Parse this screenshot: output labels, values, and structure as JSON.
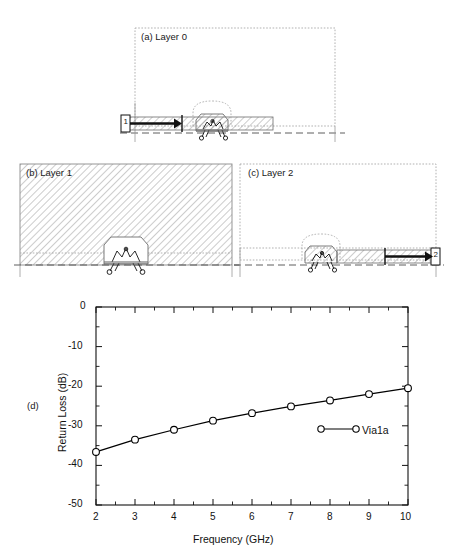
{
  "figure": {
    "panels": [
      {
        "id": "a",
        "label": "(a) Layer 0",
        "port_marker": "1"
      },
      {
        "id": "b",
        "label": "(b) Layer 1",
        "port_marker": ""
      },
      {
        "id": "c",
        "label": "(c) Layer 2",
        "port_marker": "2"
      },
      {
        "id": "d",
        "label": "(d)",
        "port_marker": ""
      }
    ]
  },
  "chart_data": {
    "type": "line",
    "title": "",
    "xlabel": "Frequency  (GHz)",
    "ylabel": "Return Loss  (dB)",
    "xlim": [
      2,
      10
    ],
    "ylim": [
      -50,
      0
    ],
    "xticks": [
      2,
      3,
      4,
      5,
      6,
      7,
      8,
      9,
      10
    ],
    "xtick_labels": [
      "2",
      "3",
      "4",
      "5",
      "6",
      "7",
      "8",
      "9",
      "10"
    ],
    "yticks": [
      0,
      -10,
      -20,
      -30,
      -40,
      -50
    ],
    "ytick_labels": [
      "0",
      "-10",
      "-20",
      "-30",
      "-40",
      "-50"
    ],
    "minor_xticks": [
      2.5,
      3.5,
      4.5,
      5.5,
      6.5,
      7.5,
      8.5,
      9.5
    ],
    "minor_yticks": [
      -5,
      -15,
      -25,
      -35,
      -45
    ],
    "grid": false,
    "legend_position": "inside-lower-right",
    "series": [
      {
        "name": "Via1a",
        "marker": "circle-open",
        "line": "solid",
        "color": "#000000",
        "x": [
          2,
          3,
          4,
          5,
          6,
          7,
          8,
          9,
          10
        ],
        "values": [
          -36.6,
          -33.5,
          -31.0,
          -28.7,
          -26.8,
          -25.1,
          -23.6,
          -22.0,
          -20.5
        ]
      }
    ]
  },
  "colors": {
    "line": "#000000",
    "hatch": "#8a8a8a",
    "dotted_outline": "#9a9a9a",
    "dashed_ground": "#555555",
    "text": "#111111"
  }
}
